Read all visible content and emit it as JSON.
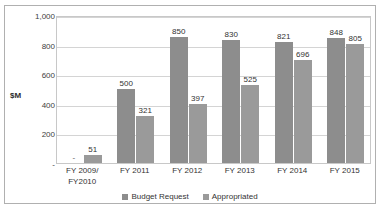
{
  "chart_data": {
    "type": "bar",
    "title": "",
    "subtitle": "",
    "xlabel": "",
    "ylabel": "$M",
    "ylim": [
      0,
      1000
    ],
    "yticks": [
      "-",
      "200",
      "400",
      "600",
      "800",
      "1,000"
    ],
    "ytick_values": [
      0,
      200,
      400,
      600,
      800,
      1000
    ],
    "grid": "horizontal",
    "legend_position": "bottom",
    "categories": [
      "FY 2009/\nFY2010",
      "FY 2011",
      "FY 2012",
      "FY 2013",
      "FY 2014",
      "FY 2015"
    ],
    "series": [
      {
        "name": "Budget Request",
        "color": "#8d8d8d",
        "values": [
          null,
          500,
          850,
          830,
          821,
          848
        ],
        "labels": [
          "-",
          "500",
          "850",
          "830",
          "821",
          "848"
        ]
      },
      {
        "name": "Appropriated",
        "color": "#9a9a9a",
        "values": [
          51,
          321,
          397,
          525,
          696,
          805
        ],
        "labels": [
          "51",
          "321",
          "397",
          "525",
          "696",
          "805"
        ]
      }
    ]
  },
  "legend": {
    "items": [
      {
        "label": "Budget Request",
        "color": "#8d8d8d"
      },
      {
        "label": "Appropriated",
        "color": "#9a9a9a"
      }
    ]
  },
  "axis": {
    "y_title": "$M"
  },
  "colors": {
    "frame_border": "#b0b0b0",
    "plot_border": "#c8c8c8",
    "gridline": "#d4d4d4",
    "text": "#333333"
  }
}
